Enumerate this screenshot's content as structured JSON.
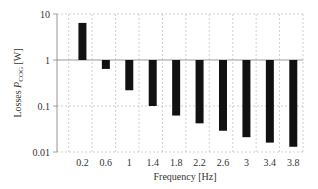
{
  "chart_data": {
    "type": "bar",
    "title": "",
    "xlabel": "Frequency [Hz]",
    "ylabel": "Losses P_COG [W]",
    "ylabel_main": "Losses ",
    "ylabel_sym": "P",
    "ylabel_sub": "COG",
    "ylabel_unit": " [W]",
    "yscale": "log",
    "ylim": [
      0.01,
      10
    ],
    "bar_baseline": 1,
    "yticks": [
      "10",
      "1",
      "0.1",
      "0.01"
    ],
    "categories": [
      "0.2",
      "0.6",
      "1",
      "1.4",
      "1.8",
      "2.2",
      "2.6",
      "3",
      "3.4",
      "3.8"
    ],
    "values": [
      6.4,
      0.64,
      0.22,
      0.1,
      0.062,
      0.042,
      0.029,
      0.021,
      0.016,
      0.013
    ],
    "grid": true,
    "legend": null,
    "colors": {
      "bar": "#111111",
      "grid": "#bbbbbb",
      "axis": "#888888"
    }
  }
}
